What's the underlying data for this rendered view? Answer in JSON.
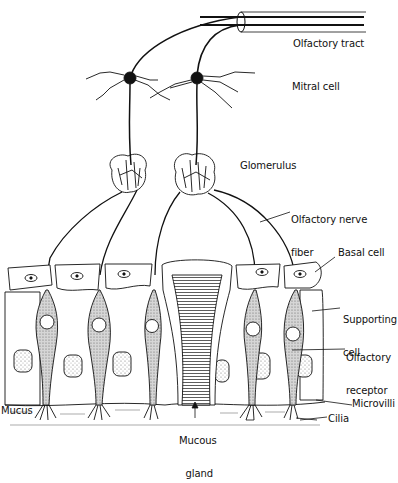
{
  "labels": {
    "olfactory_tract": "Olfactory tract",
    "mitral_cell": "Mitral cell",
    "glomerulus": "Glomerulus",
    "olfactory_nerve_fiber_1": "Olfactory nerve",
    "olfactory_nerve_fiber_2": "fiber",
    "basal_cell": "Basal cell",
    "supporting_cell_1": "Supporting",
    "supporting_cell_2": "cell",
    "olfactory_receptor_1": "Olfactory",
    "olfactory_receptor_2": "receptor",
    "microvilli": "Microvilli",
    "cilia": "Cilia",
    "mucus": "Mucus",
    "mucous_gland_1": "Mucous",
    "mucous_gland_2": "gland"
  },
  "colors": {
    "ink": "#111111",
    "stipple": "#bdbdbd",
    "background": "#ffffff"
  }
}
